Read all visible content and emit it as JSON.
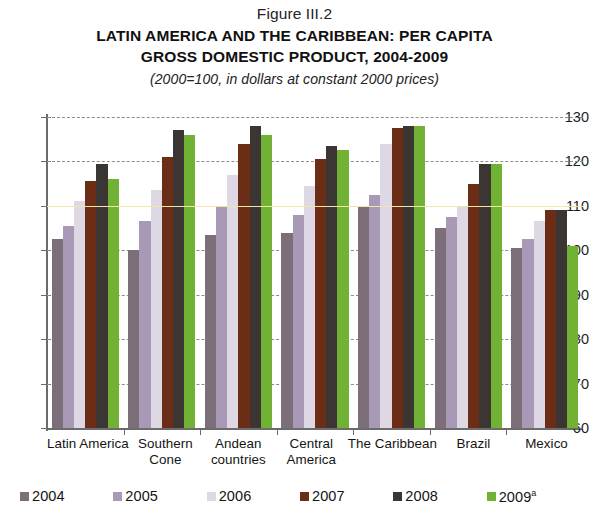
{
  "figure": {
    "number": "Figure III.2",
    "title_line1": "LATIN AMERICA AND THE CARIBBEAN: PER CAPITA",
    "title_line2": "GROSS DOMESTIC PRODUCT, 2004-2009",
    "subtitle": "(2000=100, in dollars at constant 2000 prices)"
  },
  "chart_data": {
    "type": "bar",
    "title": "LATIN AMERICA AND THE CARIBBEAN: PER CAPITA GROSS DOMESTIC PRODUCT, 2004-2009",
    "subtitle": "(2000=100, in dollars at constant 2000 prices)",
    "xlabel": "",
    "ylabel": "",
    "ylim": [
      60,
      130
    ],
    "yticks": [
      60,
      70,
      80,
      90,
      100,
      110,
      120,
      130
    ],
    "grid": true,
    "legend_position": "bottom",
    "reference_line": 110,
    "categories": [
      "Latin America",
      "Southern Cone",
      "Andean countries",
      "Central America",
      "The Caribbean",
      "Brazil",
      "Mexico"
    ],
    "category_label_lines": [
      [
        "Latin America"
      ],
      [
        "Southern",
        "Cone"
      ],
      [
        "Andean",
        "countries"
      ],
      [
        "Central",
        "America"
      ],
      [
        "The Caribbean"
      ],
      [
        "Brazil"
      ],
      [
        "Mexico"
      ]
    ],
    "series": [
      {
        "name": "2004",
        "color": "#7d6f7a",
        "values": [
          102.5,
          100.0,
          103.5,
          104.0,
          110.0,
          105.0,
          100.5
        ]
      },
      {
        "name": "2005",
        "color": "#a89ab6",
        "values": [
          105.5,
          106.5,
          110.0,
          108.0,
          112.5,
          107.5,
          102.5
        ]
      },
      {
        "name": "2006",
        "color": "#ddd8e4",
        "values": [
          111.0,
          113.5,
          117.0,
          114.5,
          124.0,
          110.0,
          106.5
        ]
      },
      {
        "name": "2007",
        "color": "#6b2d15",
        "values": [
          115.5,
          121.0,
          124.0,
          120.5,
          127.5,
          115.0,
          109.0
        ]
      },
      {
        "name": "2008",
        "color": "#3b3633",
        "values": [
          119.5,
          127.0,
          128.0,
          123.5,
          128.0,
          119.5,
          109.0
        ]
      },
      {
        "name": "2009",
        "color": "#71b133",
        "values": [
          116.0,
          126.0,
          126.0,
          122.5,
          128.0,
          119.5,
          101.0
        ]
      }
    ]
  },
  "legend": {
    "items": [
      {
        "label": "2004",
        "sup": "",
        "color": "#7d6f7a"
      },
      {
        "label": "2005",
        "sup": "",
        "color": "#a89ab6"
      },
      {
        "label": "2006",
        "sup": "",
        "color": "#ddd8e4"
      },
      {
        "label": "2007",
        "sup": "",
        "color": "#6b2d15"
      },
      {
        "label": "2008",
        "sup": "",
        "color": "#3b3633"
      },
      {
        "label": "2009",
        "sup": "a",
        "color": "#71b133"
      }
    ]
  }
}
